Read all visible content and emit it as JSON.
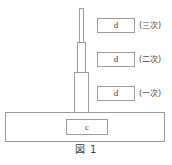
{
  "figure": {
    "caption": "図 1",
    "base": {
      "label": "c"
    },
    "mast": {
      "sections": [
        {
          "name": "section-1-lower",
          "stage": "一次"
        },
        {
          "name": "section-2-middle",
          "stage": "二次"
        },
        {
          "name": "section-3-upper",
          "stage": "三次"
        }
      ]
    },
    "stages": [
      {
        "box_label": "d",
        "stage_label": "(三次)"
      },
      {
        "box_label": "d",
        "stage_label": "(二次)"
      },
      {
        "box_label": "d",
        "stage_label": "(一次)"
      }
    ],
    "colors": {
      "line": "#9b9b9b",
      "text": "#3a3a3a",
      "background": "#ffffff"
    }
  }
}
